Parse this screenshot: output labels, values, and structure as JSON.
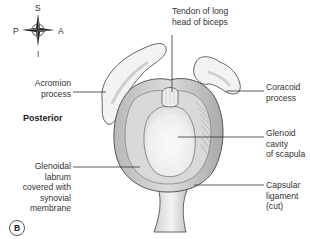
{
  "figure": {
    "panel_label": "B",
    "view_label": "Posterior",
    "orientation": {
      "superior": "S",
      "inferior": "I",
      "posterior": "P",
      "anterior": "A",
      "icon": "compass-rose-icon"
    },
    "labels": {
      "tendon": [
        "Tendon of long",
        "head of biceps"
      ],
      "acromion": [
        "Acromion",
        "process"
      ],
      "coracoid": [
        "Coracoid",
        "process"
      ],
      "glenoid_cavity": [
        "Glenoid",
        "cavity",
        "of scapula"
      ],
      "labrum": [
        "Glenoidal",
        "labrum",
        "covered with",
        "synovial",
        "membrane"
      ],
      "capsular": [
        "Capsular",
        "ligament",
        "(cut)"
      ]
    },
    "colors": {
      "outline": "#555555",
      "bone_fill": "#f2f2f2",
      "shade": "#c9c9c9",
      "leader_line": "#333333"
    }
  }
}
